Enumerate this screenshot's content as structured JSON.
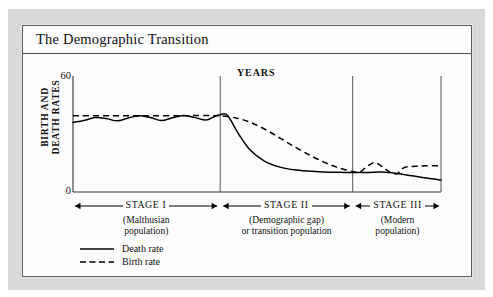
{
  "figure": {
    "title": "The Demographic Transition"
  },
  "chart_data": {
    "type": "line",
    "title": "The Demographic Transition",
    "xlabel": "YEARS",
    "ylabel": "BIRTH AND DEATH RATES",
    "ylabel_line1": "BIRTH AND",
    "ylabel_line2": "DEATH RATES",
    "ylim": [
      0,
      60
    ],
    "ytick_labels": [
      "0",
      "60"
    ],
    "xlim": [
      0,
      100
    ],
    "grid": false,
    "legend_position": "bottom-left",
    "series": [
      {
        "name": "Death rate",
        "style": "solid",
        "color": "#000000",
        "x": [
          0,
          3,
          6,
          9,
          12,
          15,
          18,
          21,
          24,
          27,
          30,
          33,
          36,
          38,
          40,
          42,
          45,
          48,
          52,
          56,
          60,
          64,
          68,
          72,
          76,
          80,
          84,
          88,
          92,
          96,
          100
        ],
        "y": [
          36,
          37,
          38.5,
          38,
          36.8,
          38.3,
          39.5,
          38.5,
          37,
          38.4,
          39.6,
          38.6,
          37.2,
          38.6,
          40,
          39.6,
          30,
          22,
          16,
          13,
          11.5,
          10.8,
          10.4,
          10.2,
          10.1,
          10.1,
          10.3,
          9.6,
          8.4,
          7.2,
          6.2
        ]
      },
      {
        "name": "Birth rate",
        "style": "dashed",
        "color": "#000000",
        "x": [
          0,
          10,
          20,
          30,
          38,
          40,
          44,
          48,
          52,
          56,
          60,
          64,
          68,
          72,
          76,
          78,
          80,
          82,
          84,
          86,
          88,
          90,
          94,
          100
        ],
        "y": [
          39.5,
          39.5,
          39.5,
          39.5,
          39.5,
          39.4,
          38.4,
          36.2,
          32.6,
          28.2,
          23.6,
          19.4,
          15.6,
          12.6,
          10.6,
          10.3,
          13.4,
          15.2,
          13.2,
          10.4,
          9.4,
          12.6,
          13.4,
          13.6
        ]
      }
    ],
    "stage_dividers_x": [
      40,
      76
    ],
    "stages": [
      {
        "name": "STAGE I",
        "subtitle_lines": [
          "(Malthusian",
          "population)"
        ],
        "x_start": 0,
        "x_end": 40
      },
      {
        "name": "STAGE II",
        "subtitle_lines": [
          "(Demographic gap)",
          "or transition population"
        ],
        "x_start": 40,
        "x_end": 76
      },
      {
        "name": "STAGE III",
        "subtitle_lines": [
          "(Modern",
          "population)"
        ],
        "x_start": 76,
        "x_end": 100
      }
    ],
    "legend": [
      {
        "label": "Death rate",
        "style": "solid"
      },
      {
        "label": "Birth rate",
        "style": "dashed"
      }
    ]
  },
  "colors": {
    "ink": "#000000",
    "mount": "#d9d9d9",
    "paper": "#fdfdfd",
    "frame": "#5d5d5d"
  }
}
